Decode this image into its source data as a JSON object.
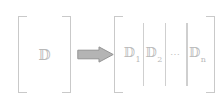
{
  "figure": {
    "stroke_color": "#c9c9c9",
    "glyph_color": "#b9b9b9",
    "arrow_fill_color": "#b0b0b0",
    "arrow_stroke_color": "#8f8f8f",
    "background_color": "#ffffff"
  },
  "source_matrix": {
    "name": "source-matrix",
    "open_bracket": "[",
    "close_bracket": "]",
    "symbol": "𝔻"
  },
  "arrow": {
    "name": "implies-arrow",
    "glyph": "⟹",
    "direction": "right"
  },
  "partitioned_matrix": {
    "name": "partitioned-matrix",
    "open_bracket": "[",
    "close_bracket": "]",
    "blocks": [
      {
        "base": "𝔻",
        "subscript": "1",
        "is_ellipsis": false
      },
      {
        "base": "𝔻",
        "subscript": "2",
        "is_ellipsis": false
      },
      {
        "base": "⋯",
        "subscript": "",
        "is_ellipsis": true
      },
      {
        "base": "𝔻",
        "subscript": "n",
        "is_ellipsis": false
      }
    ],
    "separator_count": 3
  }
}
